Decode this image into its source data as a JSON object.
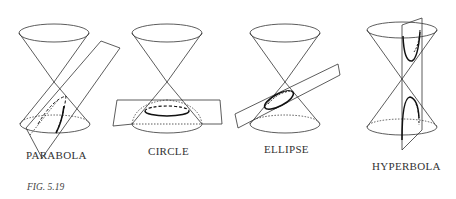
{
  "figure": {
    "caption": "FIG. 5.19",
    "panels": [
      {
        "id": "parabola",
        "label": "PARABOLA"
      },
      {
        "id": "circle",
        "label": "CIRCLE"
      },
      {
        "id": "ellipse",
        "label": "ELLIPSE"
      },
      {
        "id": "hyperbola",
        "label": "HYPERBOLA"
      }
    ],
    "colors": {
      "line": "#333333",
      "curve": "#111111",
      "background": "#ffffff"
    }
  }
}
